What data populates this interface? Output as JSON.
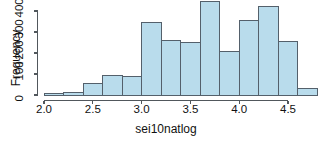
{
  "chart_data": {
    "type": "bar",
    "subtype": "histogram",
    "title": "",
    "xlabel": "sei10natlog",
    "ylabel": "Frequency",
    "xlim": [
      2.0,
      4.8
    ],
    "ylim": [
      0,
      450
    ],
    "grid": false,
    "legend": null,
    "bin_width": 0.2,
    "bin_edges": [
      2.0,
      2.2,
      2.4,
      2.6,
      2.8,
      3.0,
      3.2,
      3.4,
      3.6,
      3.8,
      4.0,
      4.2,
      4.4,
      4.6,
      4.8
    ],
    "categories": [
      "2.0-2.2",
      "2.2-2.4",
      "2.4-2.6",
      "2.6-2.8",
      "2.8-3.0",
      "3.0-3.2",
      "3.2-3.4",
      "3.4-3.6",
      "3.6-3.8",
      "3.8-4.0",
      "4.0-4.2",
      "4.2-4.4",
      "4.4-4.6",
      "4.6-4.8"
    ],
    "values": [
      5,
      10,
      55,
      95,
      90,
      345,
      260,
      250,
      445,
      205,
      355,
      420,
      255,
      30
    ],
    "xticks": [
      2.0,
      2.5,
      3.0,
      3.5,
      4.0,
      4.5
    ],
    "xtick_labels": [
      "2.0",
      "2.5",
      "3.0",
      "3.5",
      "4.0",
      "4.5"
    ],
    "yticks": [
      0,
      100,
      200,
      300,
      400
    ],
    "ytick_labels": [
      "0",
      "100",
      "200",
      "300",
      "400"
    ],
    "bar_fill_color": "#b9dcec",
    "bar_border_color": "#54606b",
    "axis_color": "#51575c"
  }
}
